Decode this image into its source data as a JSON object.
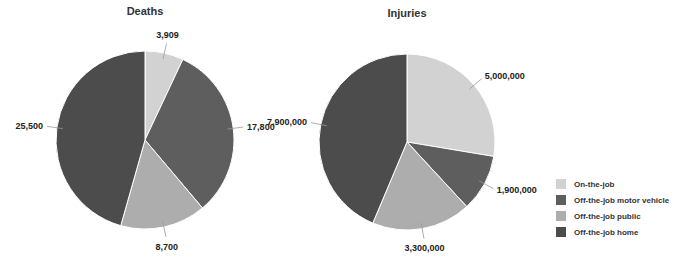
{
  "chart_data": [
    {
      "type": "pie",
      "title": "Deaths",
      "categories": [
        "On-the-job",
        "Off-the-job motor vehicle",
        "Off-the-job public",
        "Off-the-job home"
      ],
      "values": [
        3909,
        17800,
        8700,
        25500
      ],
      "labels": [
        "3,909",
        "17,800",
        "8,700",
        "25,500"
      ]
    },
    {
      "type": "pie",
      "title": "Injuries",
      "categories": [
        "On-the-job",
        "Off-the-job motor vehicle",
        "Off-the-job public",
        "Off-the-job home"
      ],
      "values": [
        5000000,
        1900000,
        3300000,
        7900000
      ],
      "labels": [
        "5,000,000",
        "1,900,000",
        "3,300,000",
        "7,900,000"
      ]
    }
  ],
  "titles": {
    "deaths": "Deaths",
    "injuries": "Injuries"
  },
  "legend": [
    {
      "label": "On-the-job",
      "color": "#d2d2d2"
    },
    {
      "label": "Off-the-job motor vehicle",
      "color": "#5e5e5e"
    },
    {
      "label": "Off-the-job public",
      "color": "#adadad"
    },
    {
      "label": "Off-the-job home",
      "color": "#4c4c4c"
    }
  ],
  "colors": [
    "#d2d2d2",
    "#5e5e5e",
    "#adadad",
    "#4c4c4c"
  ]
}
